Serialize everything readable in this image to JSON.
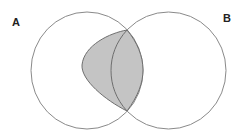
{
  "diagram": {
    "type": "venn",
    "sets": [
      {
        "id": "A",
        "label": "A"
      },
      {
        "id": "B",
        "label": "B"
      }
    ],
    "shaded_region": "region of A overlapping/adjacent to B (lens plus part of A)",
    "colors": {
      "outline": "#8a8a8a",
      "shade_fill": "#c4c4c4",
      "shade_stroke": "#6e6e6e",
      "label": "#222222"
    }
  }
}
